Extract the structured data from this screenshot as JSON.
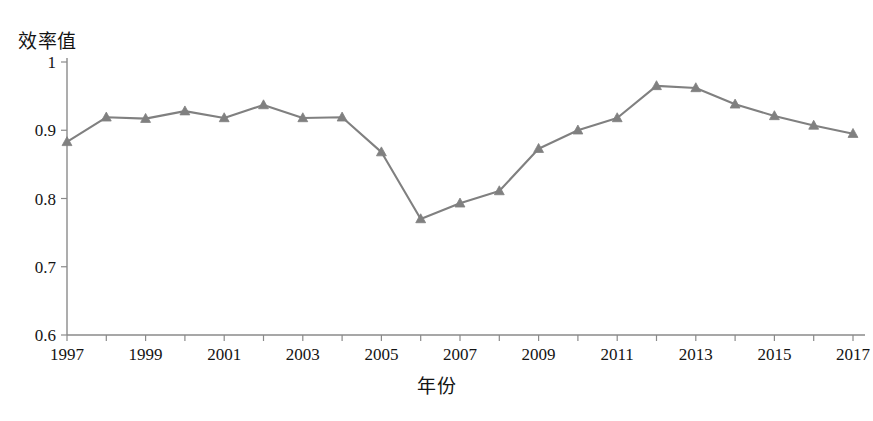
{
  "chart": {
    "type": "line",
    "ylabel": "效率值",
    "xlabel": "年份"
  },
  "chart_data": {
    "type": "line",
    "title": "",
    "subtitle": "",
    "xlabel": "年份",
    "ylabel": "效率值",
    "x": [
      1997,
      1998,
      1999,
      2000,
      2001,
      2002,
      2003,
      2004,
      2005,
      2006,
      2007,
      2008,
      2009,
      2010,
      2011,
      2012,
      2013,
      2014,
      2015,
      2016,
      2017
    ],
    "values": [
      0.883,
      0.919,
      0.917,
      0.928,
      0.918,
      0.937,
      0.918,
      0.919,
      0.868,
      0.77,
      0.793,
      0.811,
      0.873,
      0.9,
      0.918,
      0.965,
      0.962,
      0.938,
      0.921,
      0.907,
      0.895
    ],
    "series": [
      {
        "name": "效率值",
        "color": "#808080",
        "marker": "triangle",
        "values": [
          0.883,
          0.919,
          0.917,
          0.928,
          0.918,
          0.937,
          0.918,
          0.919,
          0.868,
          0.77,
          0.793,
          0.811,
          0.873,
          0.9,
          0.918,
          0.965,
          0.962,
          0.938,
          0.921,
          0.907,
          0.895
        ]
      }
    ],
    "xlim": [
      1997,
      2017
    ],
    "ylim": [
      0.6,
      1.0
    ],
    "ytick_labels": [
      "0.6",
      "0.7",
      "0.8",
      "0.9",
      "1"
    ],
    "ytick_values": [
      0.6,
      0.7,
      0.8,
      0.9,
      1.0
    ],
    "xtick_labels": [
      "1997",
      "1999",
      "2001",
      "2003",
      "2005",
      "2007",
      "2009",
      "2011",
      "2013",
      "2015",
      "2017"
    ],
    "xtick_values": [
      1997,
      1999,
      2001,
      2003,
      2005,
      2007,
      2009,
      2011,
      2013,
      2015,
      2017
    ],
    "xtick_minor_values": [
      1998,
      2000,
      2002,
      2004,
      2006,
      2008,
      2010,
      2012,
      2014,
      2016
    ],
    "grid": false,
    "legend": "none",
    "colors": {
      "line": "#808080",
      "marker": "#808080",
      "axis": "#8a8a8a",
      "text": "#141414",
      "background": "#ffffff"
    }
  }
}
